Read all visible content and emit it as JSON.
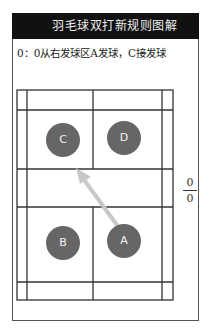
{
  "header": {
    "title": "羽毛球双打新规则图解"
  },
  "caption": "0：0从右发球区A发球，C接发球",
  "score": {
    "top": "0",
    "bottom": "0"
  },
  "players": [
    {
      "label": "C",
      "team": "receiving"
    },
    {
      "label": "D",
      "team": "receiving"
    },
    {
      "label": "B",
      "team": "serving"
    },
    {
      "label": "A",
      "team": "serving"
    }
  ],
  "arrow": {
    "from": "A",
    "to": "C",
    "color": "#c8c8c8"
  },
  "colors": {
    "header_bg": "#111111",
    "player_fill": "#666666",
    "lines": "#333333"
  }
}
